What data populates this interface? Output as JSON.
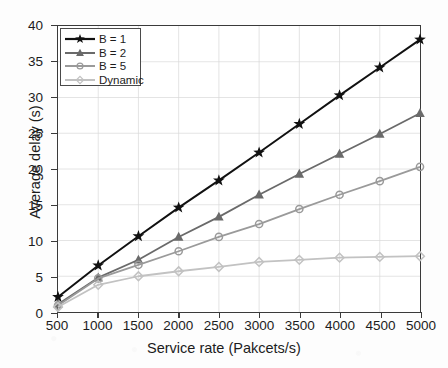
{
  "chart_data": {
    "type": "line",
    "title": "",
    "xlabel": "Service rate (Pakcets/s)",
    "ylabel": "Average delay (s)",
    "x": [
      500,
      1000,
      1500,
      2000,
      2500,
      3000,
      3500,
      4000,
      4500,
      5000
    ],
    "xlim": [
      500,
      5000
    ],
    "ylim": [
      0,
      40
    ],
    "xticks": [
      500,
      1000,
      1500,
      2000,
      2500,
      3000,
      3500,
      4000,
      4500,
      5000
    ],
    "yticks": [
      0,
      5,
      10,
      15,
      20,
      25,
      30,
      35,
      40
    ],
    "grid": true,
    "legend_position": "upper-left",
    "series": [
      {
        "name": "B = 1",
        "color": "#111111",
        "marker": "star",
        "values": [
          2.1,
          6.5,
          10.6,
          14.6,
          18.4,
          22.3,
          26.3,
          30.3,
          34.2,
          38.1
        ]
      },
      {
        "name": "B = 2",
        "color": "#6a6a6a",
        "marker": "triangle",
        "values": [
          1.1,
          4.8,
          7.3,
          10.5,
          13.3,
          16.4,
          19.3,
          22.1,
          24.9,
          27.8
        ]
      },
      {
        "name": "B = 5",
        "color": "#9a9a9a",
        "marker": "circle",
        "values": [
          0.9,
          4.7,
          6.6,
          8.5,
          10.5,
          12.3,
          14.4,
          16.4,
          18.3,
          20.3
        ]
      },
      {
        "name": "Dynamic",
        "color": "#c2c2c2",
        "marker": "diamond",
        "values": [
          0.7,
          3.8,
          5.0,
          5.7,
          6.3,
          7.0,
          7.3,
          7.6,
          7.7,
          7.8
        ]
      }
    ]
  },
  "axes": {
    "x_title": "Service rate (Pakcets/s)",
    "y_title": "Average delay (s)",
    "x_tick_labels": [
      "500",
      "1000",
      "1500",
      "2000",
      "2500",
      "3000",
      "3500",
      "4000",
      "4500",
      "5000"
    ],
    "y_tick_labels": [
      "0",
      "5",
      "10",
      "15",
      "20",
      "25",
      "30",
      "35",
      "40"
    ]
  },
  "legend": {
    "entries": [
      {
        "label": "B = 1"
      },
      {
        "label": "B = 2"
      },
      {
        "label": "B = 5"
      },
      {
        "label": "Dynamic"
      }
    ]
  }
}
